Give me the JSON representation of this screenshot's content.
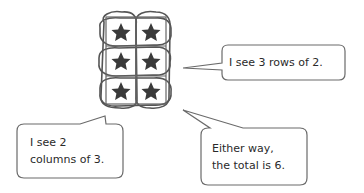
{
  "diagram": {
    "array": {
      "rows": 3,
      "columns": 2,
      "item_icon": "star-icon",
      "star_color": "#3a3a3a",
      "loop_color": "#555555"
    },
    "bubbles": [
      {
        "id": "rows",
        "lines": [
          "I see 3 rows of 2."
        ]
      },
      {
        "id": "columns",
        "lines": [
          "I see 2",
          "columns of 3."
        ]
      },
      {
        "id": "total",
        "lines": [
          "Either way,",
          "the total is 6."
        ]
      }
    ],
    "bubble_border_color": "#6a6a6a"
  }
}
